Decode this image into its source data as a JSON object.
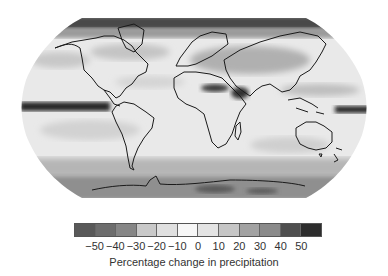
{
  "map": {
    "projection": "robinson",
    "title": "",
    "variable": "Percentage change in precipitation",
    "features": [
      {
        "name": "equatorial-pacific-east-drying-band",
        "region": "Eastern equatorial Pacific",
        "value": -50
      },
      {
        "name": "equatorial-pacific-west-band",
        "region": "Western equatorial Pacific (east of New Guinea)",
        "value": 50
      },
      {
        "name": "sahara-arabia-band",
        "region": "North Africa / Arabian Peninsula",
        "value": 40
      },
      {
        "name": "arctic-band",
        "region": "Arctic / high northern latitudes",
        "value": 40
      },
      {
        "name": "southern-ocean-band",
        "region": "Southern Ocean",
        "value": 20
      },
      {
        "name": "antarctica",
        "region": "Antarctica",
        "value": 30
      },
      {
        "name": "subtropical-north-atlantic",
        "region": "Subtropical North Atlantic",
        "value": -20
      },
      {
        "name": "subtropical-south-pacific",
        "region": "Subtropical South Pacific",
        "value": -20
      },
      {
        "name": "central-asia",
        "region": "Central Asia",
        "value": 20
      }
    ]
  },
  "colorbar": {
    "label": "Percentage change in precipitation",
    "ticks": [
      "−50",
      "−40",
      "−30",
      "−20",
      "−10",
      "0",
      "10",
      "20",
      "30",
      "40",
      "50"
    ],
    "tick_values": [
      -50,
      -40,
      -30,
      -20,
      -10,
      0,
      10,
      20,
      30,
      40,
      50
    ],
    "colors": [
      "#595959",
      "#6d6d6d",
      "#868686",
      "#c9c9c9",
      "#e0e0e0",
      "#f7f7f7",
      "#e4e4e4",
      "#c6c6c6",
      "#a2a2a2",
      "#8a8a8a",
      "#4f4f4f",
      "#2d2d2d"
    ]
  }
}
